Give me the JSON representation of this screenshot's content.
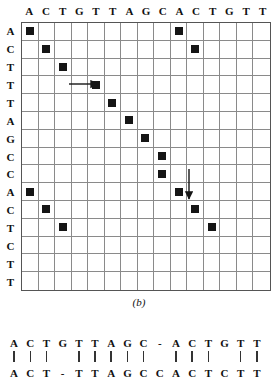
{
  "figure": {
    "caption": "(b)",
    "type": "dot-plot",
    "column_headers": [
      "A",
      "C",
      "T",
      "G",
      "T",
      "T",
      "A",
      "G",
      "C",
      "A",
      "C",
      "T",
      "G",
      "T",
      "T"
    ],
    "row_headers": [
      "A",
      "C",
      "T",
      "T",
      "T",
      "A",
      "G",
      "C",
      "C",
      "A",
      "C",
      "T",
      "C",
      "T",
      "T"
    ],
    "columns": 15,
    "rows": 15,
    "dot_color": "#151515",
    "grid_color": "#8a8a8a",
    "border_color": "#555555",
    "dots": [
      {
        "row": 1,
        "col": 1
      },
      {
        "row": 1,
        "col": 10
      },
      {
        "row": 2,
        "col": 2
      },
      {
        "row": 2,
        "col": 11
      },
      {
        "row": 3,
        "col": 3
      },
      {
        "row": 4,
        "col": 5
      },
      {
        "row": 5,
        "col": 6
      },
      {
        "row": 6,
        "col": 7
      },
      {
        "row": 7,
        "col": 8
      },
      {
        "row": 8,
        "col": 9
      },
      {
        "row": 9,
        "col": 9
      },
      {
        "row": 10,
        "col": 1
      },
      {
        "row": 10,
        "col": 10
      },
      {
        "row": 11,
        "col": 2
      },
      {
        "row": 11,
        "col": 11
      },
      {
        "row": 12,
        "col": 3
      },
      {
        "row": 12,
        "col": 12
      }
    ],
    "annotations": [
      {
        "name": "horizontal-gap-arrow",
        "direction": "right",
        "from_col": 4,
        "to_col": 5,
        "row": 4
      },
      {
        "name": "vertical-gap-arrow",
        "direction": "down",
        "col": 10,
        "from_row": 9,
        "to_row": 10
      }
    ]
  },
  "alignment": {
    "top_sequence": [
      "A",
      "C",
      "T",
      "G",
      "T",
      "T",
      "A",
      "G",
      "C",
      "-",
      "A",
      "C",
      "T",
      "G",
      "T",
      "T"
    ],
    "match_bars": [
      true,
      true,
      true,
      false,
      true,
      true,
      true,
      true,
      true,
      false,
      true,
      true,
      true,
      false,
      true,
      true
    ],
    "bottom_sequence": [
      "A",
      "C",
      "T",
      "-",
      "T",
      "T",
      "A",
      "G",
      "C",
      "C",
      "A",
      "C",
      "T",
      "C",
      "T",
      "T"
    ],
    "bar_glyph": "|",
    "gap_glyph": "-"
  }
}
